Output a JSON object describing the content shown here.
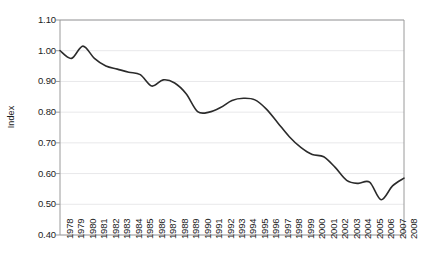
{
  "chart_data": {
    "type": "line",
    "title": "",
    "xlabel": "",
    "ylabel": "Index",
    "ylim": [
      0.4,
      1.1
    ],
    "ytick_step": 0.1,
    "grid": true,
    "legend": "none",
    "line_color": "#2b2b2b",
    "grid_color": "#e8e8ea",
    "axis_color": "#9a9a9a",
    "background": "#ffffff",
    "smoothing": "spline",
    "yticks": [
      "1.10",
      "1.00",
      "0.90",
      "0.80",
      "0.70",
      "0.60",
      "0.50",
      "0.40"
    ],
    "categories": [
      "1978",
      "1979",
      "1980",
      "1981",
      "1982",
      "1983",
      "1984",
      "1985",
      "1986",
      "1987",
      "1988",
      "1989",
      "1990",
      "1991",
      "1992",
      "1993",
      "1994",
      "1995",
      "1996",
      "1997",
      "1998",
      "1999",
      "2000",
      "2001",
      "2002",
      "2003",
      "2004",
      "2005",
      "2006",
      "2007",
      "2008"
    ],
    "values": [
      1.0,
      0.975,
      1.015,
      0.975,
      0.95,
      0.94,
      0.93,
      0.922,
      0.885,
      0.905,
      0.895,
      0.86,
      0.802,
      0.8,
      0.815,
      0.838,
      0.845,
      0.84,
      0.81,
      0.765,
      0.72,
      0.685,
      0.662,
      0.655,
      0.62,
      0.578,
      0.568,
      0.572,
      0.515,
      0.56,
      0.585
    ],
    "series": [
      {
        "name": "Index",
        "values": [
          1.0,
          0.975,
          1.015,
          0.975,
          0.95,
          0.94,
          0.93,
          0.922,
          0.885,
          0.905,
          0.895,
          0.86,
          0.802,
          0.8,
          0.815,
          0.838,
          0.845,
          0.84,
          0.81,
          0.765,
          0.72,
          0.685,
          0.662,
          0.655,
          0.62,
          0.578,
          0.568,
          0.572,
          0.515,
          0.56,
          0.585
        ]
      }
    ]
  }
}
